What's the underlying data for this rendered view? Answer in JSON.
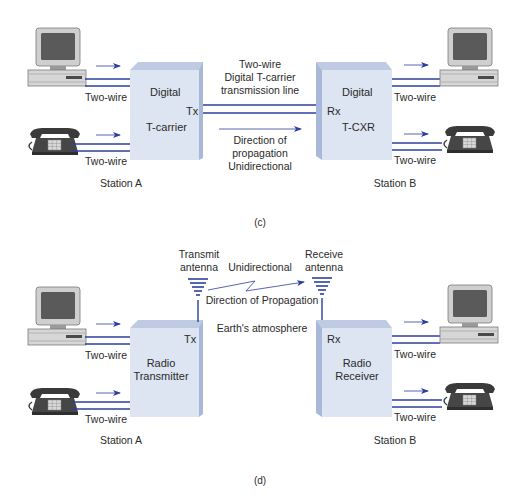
{
  "colors": {
    "wire": "#2b3f9e",
    "box_front": "#dde5f3",
    "box_top": "#bfcbe3",
    "box_side": "#b3c1dd",
    "text": "#2a2a2a",
    "device_dark": "#3a3a3a",
    "device_light": "#c9c9c9"
  },
  "panel_c": {
    "caption": "(c)",
    "station_a": {
      "label": "Station A",
      "box_line1": "Digital",
      "box_line2": "T-carrier",
      "port": "Tx",
      "computer_wire_label": "Two-wire",
      "phone_wire_label": "Two-wire"
    },
    "station_b": {
      "label": "Station B",
      "box_line1": "Digital",
      "box_line2": "T-CXR",
      "port": "Rx",
      "computer_wire_label": "Two-wire",
      "phone_wire_label": "Two-wire"
    },
    "link": {
      "line1": "Two-wire",
      "line2": "Digital T-carrier",
      "line3": "transmission line",
      "dir1": "Direction of",
      "dir2": "propagation",
      "dir3": "Unidirectional"
    }
  },
  "panel_d": {
    "caption": "(d)",
    "station_a": {
      "label": "Station A",
      "box_line1": "Radio",
      "box_line2": "Transmitter",
      "port": "Tx",
      "antenna_line1": "Transmit",
      "antenna_line2": "antenna",
      "computer_wire_label": "Two-wire",
      "phone_wire_label": "Two-wire"
    },
    "station_b": {
      "label": "Station B",
      "box_line1": "Radio",
      "box_line2": "Receiver",
      "port": "Rx",
      "antenna_line1": "Receive",
      "antenna_line2": "antenna",
      "computer_wire_label": "Two-wire",
      "phone_wire_label": "Two-wire"
    },
    "link": {
      "mode": "Unidirectional",
      "direction": "Direction of Propagation",
      "medium": "Earth's atmosphere"
    }
  }
}
